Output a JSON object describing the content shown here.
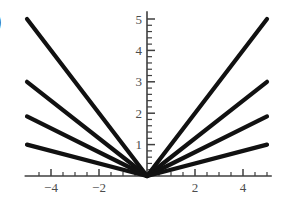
{
  "figure": {
    "panel_label": ")",
    "background_color": "#ffffff",
    "curve_color": "#111111",
    "axis_color": "#3f3f3f",
    "tick_label_color": "#4c4c4c"
  },
  "chart_data": {
    "type": "line",
    "title": "",
    "subtitle": "",
    "xlabel": "",
    "ylabel": "",
    "xlim": [
      -5.1,
      5.2
    ],
    "ylim": [
      0,
      5.25
    ],
    "grid": false,
    "legend": null,
    "annotations": [],
    "x_ticks_major": [
      -4,
      -2,
      2,
      4
    ],
    "x_tick_labels": [
      "-4",
      "-2",
      "2",
      "4"
    ],
    "x_ticks_minor": [
      -4.5,
      -3.5,
      -3,
      -2.5,
      -1.5,
      -1,
      -0.5,
      0.5,
      1,
      1.5,
      2.5,
      3,
      3.5,
      4.5,
      5
    ],
    "y_ticks_major": [
      1,
      2,
      3,
      4,
      5
    ],
    "y_tick_labels": [
      "1",
      "2",
      "3",
      "4",
      "5"
    ],
    "y_ticks_minor": [
      0.2,
      0.4,
      0.6,
      0.8,
      1.2,
      1.4,
      1.6,
      1.8,
      2.2,
      2.4,
      2.6,
      2.8,
      3.2,
      3.4,
      3.6,
      3.8,
      4.2,
      4.4,
      4.6,
      4.8
    ],
    "x": [
      -5,
      0,
      5
    ],
    "series": [
      {
        "name": "a = 1.0",
        "slope": 1.0,
        "values": [
          5,
          0,
          5
        ]
      },
      {
        "name": "a = 0.6",
        "slope": 0.6,
        "values": [
          3,
          0,
          3
        ]
      },
      {
        "name": "a = 0.38",
        "slope": 0.38,
        "values": [
          1.9,
          0,
          1.9
        ]
      },
      {
        "name": "a = 0.2",
        "slope": 0.2,
        "values": [
          1,
          0,
          1
        ]
      }
    ]
  }
}
